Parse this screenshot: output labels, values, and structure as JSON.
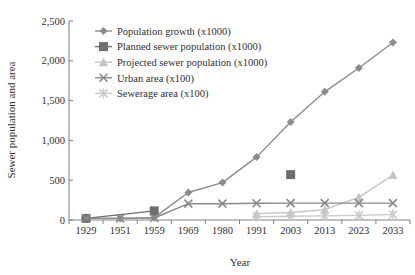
{
  "chart_data": {
    "type": "line",
    "title": "",
    "xlabel": "Year",
    "ylabel": "Sewer population and area",
    "categories": [
      "1929",
      "1951",
      "1959",
      "1969",
      "1980",
      "1991",
      "2003",
      "2013",
      "2023",
      "2033"
    ],
    "ylim": [
      0,
      2500
    ],
    "yticks": [
      "0",
      "500",
      "1,000",
      "1,500",
      "2,000",
      "2,500"
    ],
    "ytick_values": [
      0,
      500,
      1000,
      1500,
      2000,
      2500
    ],
    "grid": false,
    "legend_position": "top-left-inside",
    "series": [
      {
        "name": "Population growth (x1000)",
        "marker": "diamond",
        "color": "#8c8c8c",
        "values": [
          20,
          20,
          30,
          345,
          470,
          790,
          1230,
          1610,
          1910,
          2230
        ]
      },
      {
        "name": "Planned sewer population (x1000)",
        "marker": "square",
        "color": "#6e6e6e",
        "values": [
          20,
          null,
          115,
          null,
          null,
          null,
          570,
          null,
          null,
          null
        ]
      },
      {
        "name": "Projected sewer population (x1000)",
        "marker": "triangle",
        "color": "#c4c4c4",
        "values": [
          null,
          null,
          null,
          null,
          null,
          80,
          95,
          130,
          285,
          565
        ]
      },
      {
        "name": "Urban area (x100)",
        "marker": "cross",
        "color": "#8a8a8a",
        "values": [
          20,
          20,
          25,
          205,
          205,
          210,
          212,
          212,
          212,
          212
        ]
      },
      {
        "name": "Sewerage area (x100)",
        "marker": "star",
        "color": "#c9c9c9",
        "values": [
          null,
          null,
          null,
          null,
          null,
          40,
          48,
          52,
          58,
          70
        ]
      }
    ]
  }
}
